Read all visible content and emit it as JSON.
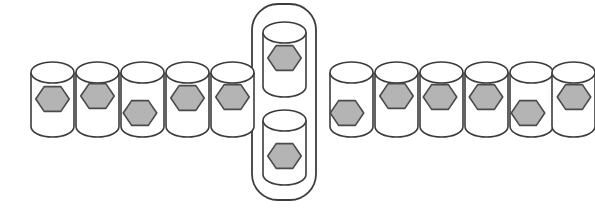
{
  "scene": {
    "title": "Row of cylindrical containers with hexagonal items",
    "width": 595,
    "height": 208,
    "background_color": "#ffffff",
    "cylinder_count_total": 13,
    "selected_group_count": 2
  },
  "style": {
    "cylinder_fill": "#ffffff",
    "cylinder_stroke": "#3c3c3c",
    "hexagon_fill": "#b4b4b4",
    "hexagon_stroke": "#4a4a4a",
    "highlight_stroke": "#3c3c3c"
  },
  "highlight_group": {
    "label": "selected-pair",
    "x": 252,
    "y": 4,
    "width": 64,
    "height": 196,
    "corner_radius": 26
  },
  "cylinders": [
    {
      "id": "cylinder-1",
      "group": "left",
      "x": 31,
      "y": 62,
      "w": 43,
      "h": 75,
      "hex_cx": 52.5,
      "hex_cy": 99,
      "hex_r": 15.5
    },
    {
      "id": "cylinder-2",
      "group": "left",
      "x": 76,
      "y": 62,
      "w": 43,
      "h": 75,
      "hex_cx": 97.5,
      "hex_cy": 96,
      "hex_r": 15.5
    },
    {
      "id": "cylinder-3",
      "group": "left",
      "x": 121,
      "y": 62,
      "w": 43,
      "h": 75,
      "hex_cx": 140.0,
      "hex_cy": 113,
      "hex_r": 15.5
    },
    {
      "id": "cylinder-4",
      "group": "left",
      "x": 166,
      "y": 62,
      "w": 43,
      "h": 75,
      "hex_cx": 187.5,
      "hex_cy": 98,
      "hex_r": 15.5
    },
    {
      "id": "cylinder-5",
      "group": "left",
      "x": 211,
      "y": 62,
      "w": 43,
      "h": 75,
      "hex_cx": 232.5,
      "hex_cy": 97,
      "hex_r": 15.5
    },
    {
      "id": "cylinder-6",
      "group": "selected",
      "x": 263,
      "y": 22,
      "w": 43,
      "h": 75,
      "hex_cx": 284.5,
      "hex_cy": 58,
      "hex_r": 15.5
    },
    {
      "id": "cylinder-7",
      "group": "selected",
      "x": 263,
      "y": 110,
      "w": 43,
      "h": 75,
      "hex_cx": 284.5,
      "hex_cy": 156,
      "hex_r": 15.5
    },
    {
      "id": "cylinder-8",
      "group": "right",
      "x": 330,
      "y": 62,
      "w": 43,
      "h": 75,
      "hex_cx": 347.0,
      "hex_cy": 113,
      "hex_r": 15.5
    },
    {
      "id": "cylinder-9",
      "group": "right",
      "x": 375,
      "y": 62,
      "w": 43,
      "h": 75,
      "hex_cx": 396.5,
      "hex_cy": 96,
      "hex_r": 15.5
    },
    {
      "id": "cylinder-10",
      "group": "right",
      "x": 420,
      "y": 62,
      "w": 43,
      "h": 75,
      "hex_cx": 440.0,
      "hex_cy": 97,
      "hex_r": 15.5
    },
    {
      "id": "cylinder-11",
      "group": "right",
      "x": 465,
      "y": 62,
      "w": 43,
      "h": 75,
      "hex_cx": 486.0,
      "hex_cy": 97,
      "hex_r": 15.5
    },
    {
      "id": "cylinder-12",
      "group": "right",
      "x": 510,
      "y": 62,
      "w": 43,
      "h": 75,
      "hex_cx": 528.0,
      "hex_cy": 113,
      "hex_r": 15.5
    },
    {
      "id": "cylinder-13",
      "group": "right",
      "x": 552,
      "y": 62,
      "w": 43,
      "h": 75,
      "hex_cx": 574.0,
      "hex_cy": 97,
      "hex_r": 15.5
    }
  ]
}
